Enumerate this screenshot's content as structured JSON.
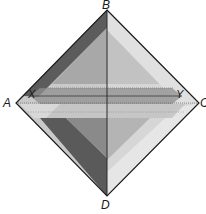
{
  "diagram": {
    "title": "",
    "vertices": {
      "A": {
        "label": "A",
        "x": 16,
        "y": 103
      },
      "B": {
        "label": "B",
        "x": 107,
        "y": 10
      },
      "C": {
        "label": "C",
        "x": 199,
        "y": 103
      },
      "D": {
        "label": "D",
        "x": 107,
        "y": 196
      }
    },
    "points": {
      "X": {
        "label": "X",
        "x": 31,
        "y": 96
      },
      "Y": {
        "label": "Y",
        "x": 181,
        "y": 96
      }
    },
    "lines": [
      {
        "name": "diagonal-BD",
        "from": "B",
        "to": "D",
        "style": "solid"
      },
      {
        "name": "line-XY",
        "from": "X",
        "to": "Y",
        "style": "solid"
      },
      {
        "name": "line-AC",
        "from": "A",
        "to": "C",
        "style": "dotted"
      }
    ],
    "colors": {
      "outline": "#1a1a1a",
      "dark_band": "#5a5a5a",
      "mid_dark": "#7a7a7a",
      "mid": "#9c9c9c",
      "light": "#bdbdbd",
      "lighter": "#d4d4d4",
      "lightest": "#e4e4e4",
      "background": "#ffffff"
    }
  }
}
